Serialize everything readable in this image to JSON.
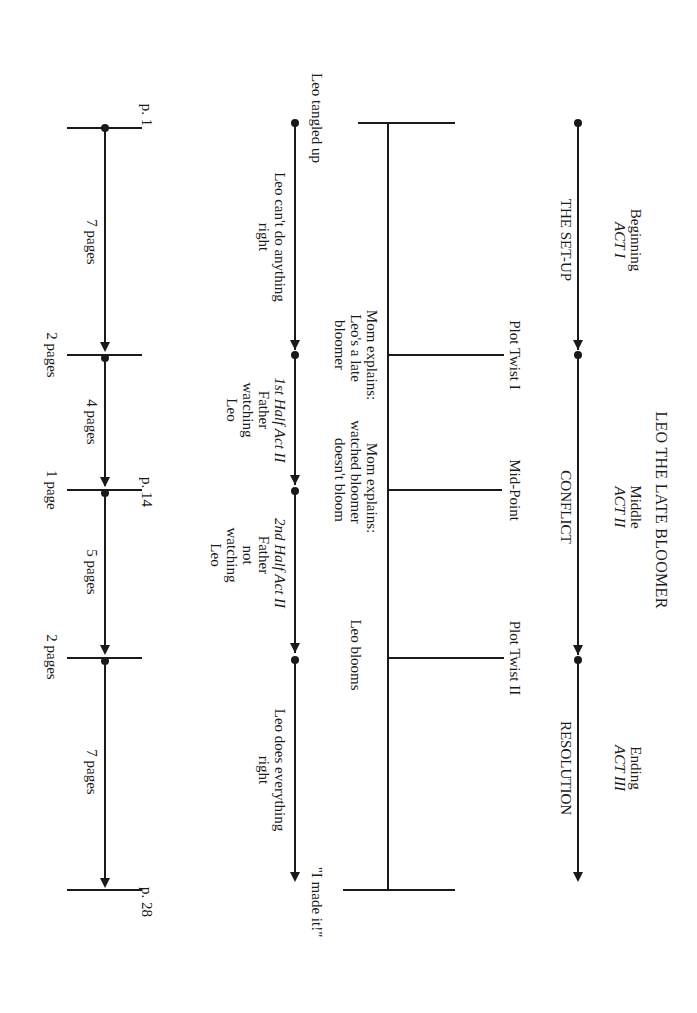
{
  "title": "LEO THE LATE BLOOMER",
  "acts": [
    {
      "name": "Beginning",
      "act": "ACT I",
      "label": "THE SET-UP"
    },
    {
      "name": "Middle",
      "act": "ACT II",
      "label": "CONFLICT"
    },
    {
      "name": "Ending",
      "act": "ACT III",
      "label": "RESOLUTION"
    }
  ],
  "plot_points": [
    "Plot Twist I",
    "Mid-Point",
    "Plot Twist II"
  ],
  "events": {
    "mom_explains_1": [
      "Mom explains:",
      "Leo's a late",
      "bloomer"
    ],
    "mom_explains_2": [
      "Mom explains:",
      "watched bloomer",
      "doesn't bloom"
    ],
    "leo_blooms": "Leo blooms"
  },
  "sequences": {
    "start": "Leo tangled up",
    "end": "\"I made it!\"",
    "seg1": [
      "Leo can't do anything",
      "right"
    ],
    "seg2": {
      "title": "1st Half Act II",
      "lines": [
        "Father",
        "watching",
        "Leo"
      ]
    },
    "seg3": {
      "title": "2nd Half Act II",
      "lines": [
        "Father",
        "not",
        "watching",
        "Leo"
      ]
    },
    "seg4": [
      "Leo does everything",
      "right"
    ]
  },
  "pages": {
    "markers": [
      "p. 1",
      "p. 14",
      "p. 28"
    ],
    "spans": [
      "7 pages",
      "4 pages",
      "5 pages",
      "7 pages"
    ],
    "gaps": [
      "2 pages",
      "1 page",
      "2 pages"
    ]
  }
}
